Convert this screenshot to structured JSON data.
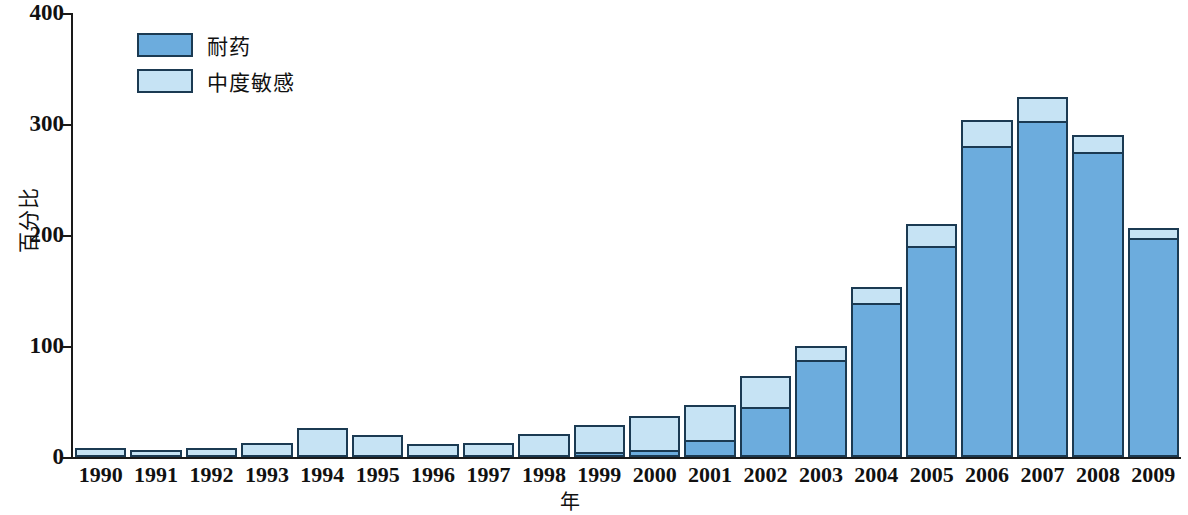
{
  "chart_data": {
    "type": "bar",
    "title": "",
    "subtitle": "",
    "xlabel": "年",
    "ylabel": "百分比",
    "stacked": true,
    "grid": false,
    "legend_position": "top-left",
    "ylim": [
      0,
      400
    ],
    "yticks": [
      0,
      100,
      200,
      300,
      400
    ],
    "categories": [
      "1990",
      "1991",
      "1992",
      "1993",
      "1994",
      "1995",
      "1996",
      "1997",
      "1998",
      "1999",
      "2000",
      "2001",
      "2002",
      "2003",
      "2004",
      "2005",
      "2006",
      "2007",
      "2008",
      "2009"
    ],
    "series": [
      {
        "name": "耐药",
        "color": "#6cacdd",
        "values": [
          0,
          0,
          0,
          0,
          0,
          0,
          0,
          0,
          0,
          3,
          6,
          15,
          45,
          87,
          139,
          190,
          280,
          303,
          275,
          197
        ]
      },
      {
        "name": "中度敏感",
        "color": "#c6e3f4",
        "values": [
          8,
          6,
          8,
          13,
          26,
          20,
          12,
          13,
          21,
          26,
          33,
          34,
          30,
          15,
          16,
          22,
          25,
          23,
          17,
          11
        ]
      }
    ],
    "totals": [
      8,
      6,
      8,
      13,
      26,
      20,
      12,
      13,
      21,
      29,
      39,
      49,
      75,
      102,
      155,
      212,
      305,
      326,
      292,
      208
    ]
  },
  "legend": {
    "items": [
      {
        "label": "耐药",
        "swatch": "dark"
      },
      {
        "label": "中度敏感",
        "swatch": "light"
      }
    ]
  }
}
